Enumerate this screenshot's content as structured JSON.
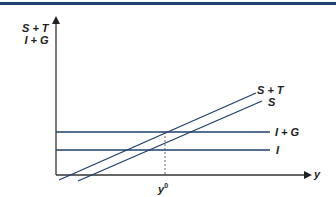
{
  "diagram": {
    "title": "",
    "y_axis_label_line1": "S + T",
    "y_axis_label_line2": "I + G",
    "x_axis_label": "y",
    "equilibrium_label": "y",
    "equilibrium_sup": "0",
    "curves": [
      {
        "name": "S + T",
        "label": "S + T",
        "type": "upward-sloping"
      },
      {
        "name": "S",
        "label": "S",
        "type": "upward-sloping"
      },
      {
        "name": "I + G",
        "label": "I + G",
        "type": "horizontal"
      },
      {
        "name": "I",
        "label": "I",
        "type": "horizontal"
      }
    ],
    "colors": {
      "line": "#1f3f6e",
      "axis": "#333333",
      "rule": "#1f3f6e"
    }
  }
}
